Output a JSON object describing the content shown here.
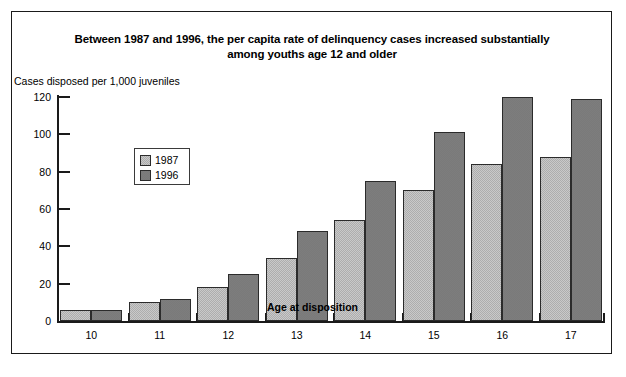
{
  "figure": {
    "title": "Between 1987 and 1996, the per capita rate of delinquency cases increased substantially among youths age 12 and older",
    "title_line1": "Between 1987 and 1996, the per capita rate of delinquency cases increased substantially",
    "title_line2": "among youths age 12 and older",
    "ylabel": "Cases disposed per 1,000 juveniles",
    "xlabel": "Age at disposition"
  },
  "legend": {
    "position": "upper-left-inside",
    "entries": [
      {
        "label": "1987",
        "color": "#c9c9c9"
      },
      {
        "label": "1996",
        "color": "#7d7d7d"
      }
    ]
  },
  "chart_data": {
    "type": "bar",
    "title": "Between 1987 and 1996, the per capita rate of delinquency cases increased substantially among youths age 12 and older",
    "xlabel": "Age at disposition",
    "ylabel": "Cases disposed per 1,000 juveniles",
    "categories": [
      "10",
      "11",
      "12",
      "13",
      "14",
      "15",
      "16",
      "17"
    ],
    "series": [
      {
        "name": "1987",
        "color": "#c9c9c9",
        "values": [
          6,
          10,
          18,
          34,
          54,
          70,
          84,
          88
        ]
      },
      {
        "name": "1996",
        "color": "#7d7d7d",
        "values": [
          6,
          12,
          25,
          48,
          75,
          101,
          120,
          119
        ]
      }
    ],
    "ylim": [
      0,
      120
    ],
    "yticks": [
      0,
      20,
      40,
      60,
      80,
      100,
      120
    ],
    "ytick_labels": [
      "0",
      "20",
      "40",
      "60",
      "80",
      "100",
      "120"
    ],
    "grid": false,
    "legend_position": "upper left"
  }
}
